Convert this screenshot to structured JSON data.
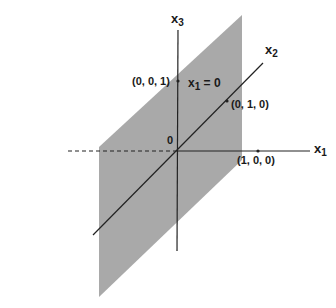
{
  "figure": {
    "type": "3d-coordinate-plane-diagram",
    "plane": {
      "label": "x",
      "label_sub": "1",
      "label_eq": "= 0",
      "fill_color": "#a9a9a9"
    },
    "axes": {
      "x1": {
        "base": "x",
        "sub": "1"
      },
      "x2": {
        "base": "x",
        "sub": "2"
      },
      "x3": {
        "base": "x",
        "sub": "3"
      }
    },
    "origin_label": "0",
    "points": [
      {
        "label": "(0, 0, 1)"
      },
      {
        "label": "(0, 1, 0)"
      },
      {
        "label": "(1, 0, 0)"
      }
    ],
    "colors": {
      "line": "#222222",
      "plane": "#a9a9a9",
      "background": "#ffffff"
    }
  }
}
